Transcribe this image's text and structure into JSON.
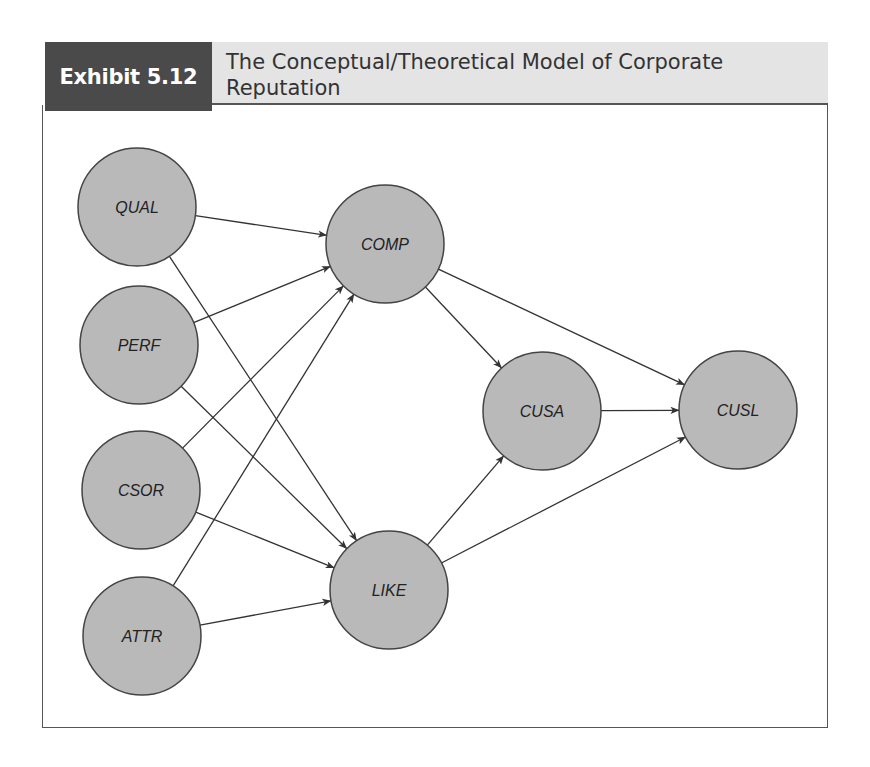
{
  "exhibit": {
    "label": "Exhibit 5.12",
    "title_line1": "The Conceptual/Theoretical Model of Corporate",
    "title_line2": "Reputation"
  },
  "colors": {
    "label_bg": "#4a4a4a",
    "title_bg": "#e4e4e4",
    "node_fill": "#b9b9b9",
    "node_stroke": "#444444",
    "edge": "#333333"
  },
  "nodes": [
    {
      "id": "QUAL",
      "label": "QUAL",
      "cx": 137,
      "cy": 207,
      "r": 59
    },
    {
      "id": "PERF",
      "label": "PERF",
      "cx": 139,
      "cy": 345,
      "r": 59
    },
    {
      "id": "CSOR",
      "label": "CSOR",
      "cx": 141,
      "cy": 490,
      "r": 59
    },
    {
      "id": "ATTR",
      "label": "ATTR",
      "cx": 142,
      "cy": 636,
      "r": 59
    },
    {
      "id": "COMP",
      "label": "COMP",
      "cx": 385,
      "cy": 244,
      "r": 59
    },
    {
      "id": "LIKE",
      "label": "LIKE",
      "cx": 389,
      "cy": 590,
      "r": 59
    },
    {
      "id": "CUSA",
      "label": "CUSA",
      "cx": 542,
      "cy": 411,
      "r": 59
    },
    {
      "id": "CUSL",
      "label": "CUSL",
      "cx": 738,
      "cy": 410,
      "r": 59
    }
  ],
  "edges": [
    {
      "from": "QUAL",
      "to": "COMP"
    },
    {
      "from": "QUAL",
      "to": "LIKE"
    },
    {
      "from": "PERF",
      "to": "COMP"
    },
    {
      "from": "PERF",
      "to": "LIKE"
    },
    {
      "from": "CSOR",
      "to": "COMP"
    },
    {
      "from": "CSOR",
      "to": "LIKE"
    },
    {
      "from": "ATTR",
      "to": "COMP"
    },
    {
      "from": "ATTR",
      "to": "LIKE"
    },
    {
      "from": "COMP",
      "to": "CUSA"
    },
    {
      "from": "COMP",
      "to": "CUSL"
    },
    {
      "from": "LIKE",
      "to": "CUSA"
    },
    {
      "from": "LIKE",
      "to": "CUSL"
    },
    {
      "from": "CUSA",
      "to": "CUSL"
    }
  ]
}
